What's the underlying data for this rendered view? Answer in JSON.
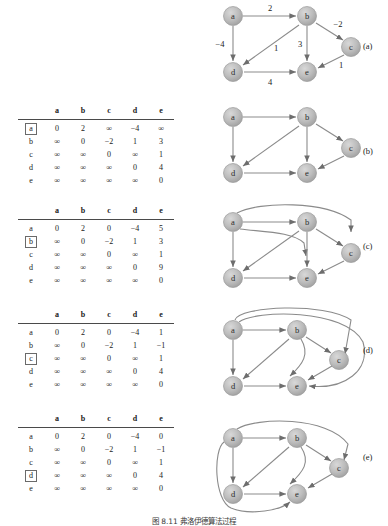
{
  "figure": {
    "caption": "图 8.11  弗洛伊德算法过程",
    "node_labels": [
      "a",
      "b",
      "c",
      "d",
      "e"
    ],
    "infinity_symbol": "∞"
  },
  "panels": [
    {
      "tag": "(a)",
      "has_matrix": false,
      "graph": {
        "name": "graph-a-weighted",
        "weighted": true,
        "nodes": [
          {
            "id": "a",
            "label": "a",
            "x": 28,
            "y": 14
          },
          {
            "id": "b",
            "label": "b",
            "x": 102,
            "y": 14
          },
          {
            "id": "c",
            "label": "c",
            "x": 146,
            "y": 45
          },
          {
            "id": "d",
            "label": "d",
            "x": 28,
            "y": 70
          },
          {
            "id": "e",
            "label": "e",
            "x": 102,
            "y": 70
          }
        ],
        "edges": [
          {
            "from": "a",
            "to": "b",
            "weight": "2",
            "label_x": 65,
            "label_y": 6
          },
          {
            "from": "a",
            "to": "d",
            "weight": "−4",
            "label_x": 14,
            "label_y": 43
          },
          {
            "from": "b",
            "to": "d",
            "weight": "1",
            "label_x": 70,
            "label_y": 47
          },
          {
            "from": "b",
            "to": "e",
            "weight": "3",
            "label_x": 94,
            "label_y": 43
          },
          {
            "from": "b",
            "to": "c",
            "weight": "−2",
            "label_x": 132,
            "label_y": 23
          },
          {
            "from": "c",
            "to": "e",
            "weight": "1",
            "label_x": 134,
            "label_y": 63
          },
          {
            "from": "d",
            "to": "e",
            "weight": "4",
            "label_x": 65,
            "label_y": 80
          }
        ]
      }
    },
    {
      "tag": "(b)",
      "has_matrix": true,
      "matrix": {
        "name": "matrix-b",
        "col_headers": [
          "a",
          "b",
          "c",
          "d",
          "e"
        ],
        "row_headers": [
          "a",
          "b",
          "c",
          "d",
          "e"
        ],
        "highlighted_row": "a",
        "rows": [
          [
            "0",
            "2",
            "∞",
            "−4",
            "∞"
          ],
          [
            "∞",
            "0",
            "−2",
            "1",
            "3"
          ],
          [
            "∞",
            "∞",
            "0",
            "∞",
            "1"
          ],
          [
            "∞",
            "∞",
            "∞",
            "0",
            "4"
          ],
          [
            "∞",
            "∞",
            "∞",
            "∞",
            "0"
          ]
        ]
      },
      "graph": {
        "name": "graph-b-unweighted",
        "weighted": false,
        "nodes": [
          {
            "id": "a",
            "label": "a",
            "x": 28,
            "y": 14
          },
          {
            "id": "b",
            "label": "b",
            "x": 102,
            "y": 14
          },
          {
            "id": "c",
            "label": "c",
            "x": 146,
            "y": 45
          },
          {
            "id": "d",
            "label": "d",
            "x": 28,
            "y": 70
          },
          {
            "id": "e",
            "label": "e",
            "x": 102,
            "y": 70
          }
        ],
        "edges": [
          {
            "from": "a",
            "to": "b"
          },
          {
            "from": "a",
            "to": "d"
          },
          {
            "from": "b",
            "to": "d"
          },
          {
            "from": "b",
            "to": "e"
          },
          {
            "from": "b",
            "to": "c"
          },
          {
            "from": "c",
            "to": "e"
          },
          {
            "from": "d",
            "to": "e"
          }
        ]
      }
    },
    {
      "tag": "(c)",
      "has_matrix": true,
      "matrix": {
        "name": "matrix-c",
        "col_headers": [
          "a",
          "b",
          "c",
          "d",
          "e"
        ],
        "row_headers": [
          "a",
          "b",
          "c",
          "d",
          "e"
        ],
        "highlighted_row": "b",
        "rows": [
          [
            "0",
            "2",
            "0",
            "−4",
            "5"
          ],
          [
            "∞",
            "0",
            "−2",
            "1",
            "3"
          ],
          [
            "∞",
            "∞",
            "0",
            "∞",
            "1"
          ],
          [
            "∞",
            "∞",
            "∞",
            "0",
            "9"
          ],
          [
            "∞",
            "∞",
            "∞",
            "∞",
            "0"
          ]
        ]
      },
      "graph": {
        "name": "graph-c-unweighted",
        "weighted": false,
        "nodes": [
          {
            "id": "a",
            "label": "a",
            "x": 28,
            "y": 24
          },
          {
            "id": "b",
            "label": "b",
            "x": 102,
            "y": 24
          },
          {
            "id": "c",
            "label": "c",
            "x": 146,
            "y": 55
          },
          {
            "id": "d",
            "label": "d",
            "x": 28,
            "y": 80
          },
          {
            "id": "e",
            "label": "e",
            "x": 102,
            "y": 80
          }
        ],
        "edges": [
          {
            "from": "a",
            "to": "b"
          },
          {
            "from": "a",
            "to": "d"
          },
          {
            "from": "a",
            "to": "c",
            "curved": true
          },
          {
            "from": "a",
            "to": "e",
            "curved": true
          },
          {
            "from": "b",
            "to": "d"
          },
          {
            "from": "b",
            "to": "e"
          },
          {
            "from": "b",
            "to": "c"
          },
          {
            "from": "c",
            "to": "e"
          },
          {
            "from": "d",
            "to": "e"
          }
        ]
      }
    },
    {
      "tag": "(d)",
      "has_matrix": true,
      "matrix": {
        "name": "matrix-d",
        "col_headers": [
          "a",
          "b",
          "c",
          "d",
          "e"
        ],
        "row_headers": [
          "a",
          "b",
          "c",
          "d",
          "e"
        ],
        "highlighted_row": "c",
        "rows": [
          [
            "0",
            "2",
            "0",
            "−4",
            "1"
          ],
          [
            "∞",
            "0",
            "−2",
            "1",
            "−1"
          ],
          [
            "∞",
            "∞",
            "0",
            "∞",
            "1"
          ],
          [
            "∞",
            "∞",
            "∞",
            "0",
            "4"
          ],
          [
            "∞",
            "∞",
            "∞",
            "∞",
            "0"
          ]
        ]
      },
      "graph": {
        "name": "graph-d-unweighted",
        "weighted": false,
        "nodes": [
          {
            "id": "a",
            "label": "a",
            "x": 28,
            "y": 32
          },
          {
            "id": "b",
            "label": "b",
            "x": 92,
            "y": 32
          },
          {
            "id": "c",
            "label": "c",
            "x": 134,
            "y": 62
          },
          {
            "id": "d",
            "label": "d",
            "x": 28,
            "y": 88
          },
          {
            "id": "e",
            "label": "e",
            "x": 92,
            "y": 88
          }
        ],
        "edges": [
          {
            "from": "a",
            "to": "b"
          },
          {
            "from": "a",
            "to": "d"
          },
          {
            "from": "a",
            "to": "c",
            "curved": true
          },
          {
            "from": "a",
            "to": "e",
            "curved": true
          },
          {
            "from": "b",
            "to": "d"
          },
          {
            "from": "b",
            "to": "e"
          },
          {
            "from": "b",
            "to": "c"
          },
          {
            "from": "c",
            "to": "e"
          },
          {
            "from": "d",
            "to": "e"
          }
        ]
      }
    },
    {
      "tag": "(e)",
      "has_matrix": true,
      "matrix": {
        "name": "matrix-e",
        "col_headers": [
          "a",
          "b",
          "c",
          "d",
          "e"
        ],
        "row_headers": [
          "a",
          "b",
          "c",
          "d",
          "e"
        ],
        "highlighted_row": "d",
        "rows": [
          [
            "0",
            "2",
            "0",
            "−4",
            "0"
          ],
          [
            "∞",
            "0",
            "−2",
            "1",
            "−1"
          ],
          [
            "∞",
            "∞",
            "0",
            "∞",
            "1"
          ],
          [
            "∞",
            "∞",
            "∞",
            "0",
            "4"
          ],
          [
            "∞",
            "∞",
            "∞",
            "∞",
            "0"
          ]
        ]
      },
      "graph": {
        "name": "graph-e-unweighted",
        "weighted": false,
        "nodes": [
          {
            "id": "a",
            "label": "a",
            "x": 28,
            "y": 30
          },
          {
            "id": "b",
            "label": "b",
            "x": 92,
            "y": 30
          },
          {
            "id": "c",
            "label": "c",
            "x": 134,
            "y": 60
          },
          {
            "id": "d",
            "label": "d",
            "x": 28,
            "y": 86
          },
          {
            "id": "e",
            "label": "e",
            "x": 92,
            "y": 86
          }
        ],
        "edges": [
          {
            "from": "a",
            "to": "b"
          },
          {
            "from": "a",
            "to": "d"
          },
          {
            "from": "a",
            "to": "c",
            "curved": true
          },
          {
            "from": "a",
            "to": "e",
            "curved": true
          },
          {
            "from": "b",
            "to": "d"
          },
          {
            "from": "b",
            "to": "e"
          },
          {
            "from": "b",
            "to": "c"
          },
          {
            "from": "c",
            "to": "e"
          },
          {
            "from": "d",
            "to": "e"
          }
        ]
      }
    }
  ]
}
